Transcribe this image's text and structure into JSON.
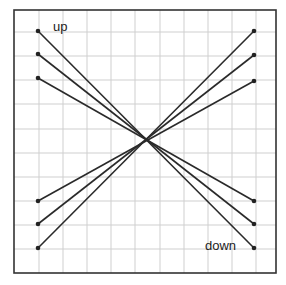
{
  "labels": {
    "up": "up",
    "down": "down"
  },
  "diagram": {
    "frame": {
      "x": 14,
      "y": 10,
      "w": 262,
      "h": 263
    },
    "grid_spacing": 24.2,
    "line_color": "#2a2a2a",
    "grid_color": "#c8c8c8",
    "crossing_point": [
      147,
      140
    ],
    "up_lines": [
      {
        "from": [
          38,
          248
        ],
        "to": [
          254,
          31
        ]
      },
      {
        "from": [
          38,
          224
        ],
        "to": [
          254,
          55
        ]
      },
      {
        "from": [
          38,
          201
        ],
        "to": [
          254,
          81
        ]
      }
    ],
    "down_lines": [
      {
        "from": [
          38,
          31
        ],
        "to": [
          254,
          248
        ]
      },
      {
        "from": [
          38,
          54
        ],
        "to": [
          254,
          224
        ]
      },
      {
        "from": [
          38,
          78
        ],
        "to": [
          254,
          201
        ]
      }
    ]
  }
}
